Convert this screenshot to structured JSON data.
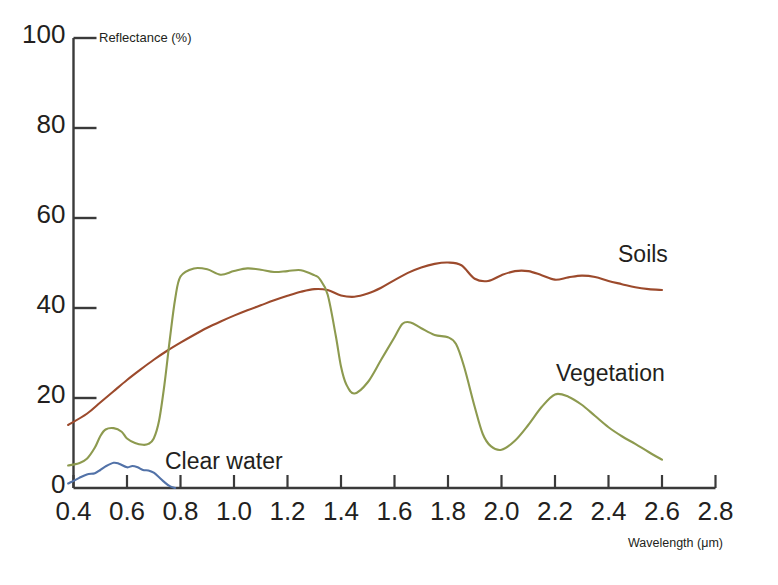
{
  "chart_data": {
    "type": "line",
    "title": "",
    "xlabel": "Wavelength (μm)",
    "ylabel": "Reflectance (%)",
    "xlim": [
      0.35,
      2.8
    ],
    "ylim": [
      0,
      100
    ],
    "xticks": [
      "0.4",
      "0.6",
      "0.8",
      "1.0",
      "1.2",
      "1.4",
      "1.6",
      "1.8",
      "2.0",
      "2.2",
      "2.4",
      "2.6",
      "2.8"
    ],
    "xtick_values": [
      0.4,
      0.6,
      0.8,
      1.0,
      1.2,
      1.4,
      1.6,
      1.8,
      2.0,
      2.2,
      2.4,
      2.6,
      2.8
    ],
    "yticks": [
      "0",
      "20",
      "40",
      "60",
      "80",
      "100"
    ],
    "ytick_values": [
      0,
      20,
      40,
      60,
      80,
      100
    ],
    "grid": false,
    "legend_position": "inline-annotations",
    "series": [
      {
        "name": "Soils",
        "color": "#9c4a2c",
        "label_x": 2.45,
        "label_y": 55,
        "x": [
          0.38,
          0.45,
          0.5,
          0.55,
          0.6,
          0.65,
          0.7,
          0.75,
          0.8,
          0.85,
          0.9,
          0.95,
          1.0,
          1.05,
          1.1,
          1.15,
          1.2,
          1.25,
          1.3,
          1.35,
          1.4,
          1.45,
          1.5,
          1.55,
          1.6,
          1.65,
          1.7,
          1.75,
          1.8,
          1.85,
          1.9,
          1.95,
          2.0,
          2.05,
          2.1,
          2.15,
          2.2,
          2.25,
          2.3,
          2.35,
          2.4,
          2.45,
          2.5,
          2.55,
          2.6
        ],
        "y": [
          14.0,
          16.5,
          19.0,
          21.5,
          24.0,
          26.3,
          28.5,
          30.5,
          32.3,
          34.0,
          35.6,
          37.0,
          38.3,
          39.5,
          40.6,
          41.7,
          42.7,
          43.6,
          44.2,
          44.0,
          42.8,
          42.5,
          43.2,
          44.5,
          46.2,
          47.8,
          49.0,
          49.8,
          50.1,
          49.5,
          46.5,
          46.0,
          47.3,
          48.2,
          48.2,
          47.3,
          46.3,
          46.8,
          47.2,
          46.9,
          46.0,
          45.3,
          44.6,
          44.2,
          44.0
        ]
      },
      {
        "name": "Vegetation",
        "color": "#8d9a4f",
        "label_x": 2.05,
        "label_y": 30,
        "x": [
          0.38,
          0.42,
          0.45,
          0.48,
          0.5,
          0.52,
          0.55,
          0.58,
          0.6,
          0.63,
          0.66,
          0.68,
          0.7,
          0.72,
          0.74,
          0.76,
          0.78,
          0.8,
          0.85,
          0.9,
          0.95,
          1.0,
          1.05,
          1.1,
          1.15,
          1.2,
          1.25,
          1.3,
          1.32,
          1.35,
          1.38,
          1.4,
          1.42,
          1.45,
          1.5,
          1.55,
          1.6,
          1.63,
          1.66,
          1.7,
          1.75,
          1.8,
          1.83,
          1.86,
          1.9,
          1.93,
          1.96,
          2.0,
          2.05,
          2.1,
          2.15,
          2.2,
          2.25,
          2.3,
          2.35,
          2.4,
          2.45,
          2.5,
          2.55,
          2.6
        ],
        "y": [
          5.0,
          5.5,
          6.5,
          9.0,
          11.5,
          13.0,
          13.3,
          12.5,
          11.0,
          10.0,
          9.6,
          9.8,
          11.0,
          15.0,
          23.0,
          33.0,
          42.0,
          47.0,
          48.8,
          48.6,
          47.4,
          48.2,
          48.8,
          48.5,
          48.0,
          48.2,
          48.4,
          47.3,
          46.5,
          43.0,
          34.0,
          27.0,
          23.0,
          21.0,
          23.5,
          28.5,
          33.5,
          36.5,
          36.8,
          35.5,
          34.0,
          33.5,
          32.0,
          27.0,
          18.0,
          12.0,
          9.3,
          8.5,
          10.5,
          14.0,
          18.0,
          20.8,
          20.3,
          18.5,
          16.0,
          13.5,
          11.5,
          9.8,
          8.0,
          6.3
        ]
      },
      {
        "name": "Clear water",
        "color": "#5272a8",
        "label_x": 0.83,
        "label_y": 7,
        "x": [
          0.38,
          0.42,
          0.45,
          0.48,
          0.5,
          0.52,
          0.55,
          0.57,
          0.6,
          0.62,
          0.64,
          0.66,
          0.68,
          0.7,
          0.72,
          0.74,
          0.76,
          0.78
        ],
        "y": [
          1.0,
          2.2,
          3.0,
          3.3,
          4.0,
          4.8,
          5.6,
          5.4,
          4.6,
          4.9,
          4.6,
          4.0,
          3.9,
          3.4,
          2.4,
          1.3,
          0.4,
          0.0
        ]
      }
    ]
  },
  "axis": {
    "y_title": "Reflectance (%)",
    "x_title": "Wavelength (μm)"
  },
  "colors": {
    "soils": "#9c4a2c",
    "vegetation": "#8d9a4f",
    "clear_water": "#5272a8",
    "axis": "#3a3a3a",
    "text": "#231f20"
  }
}
